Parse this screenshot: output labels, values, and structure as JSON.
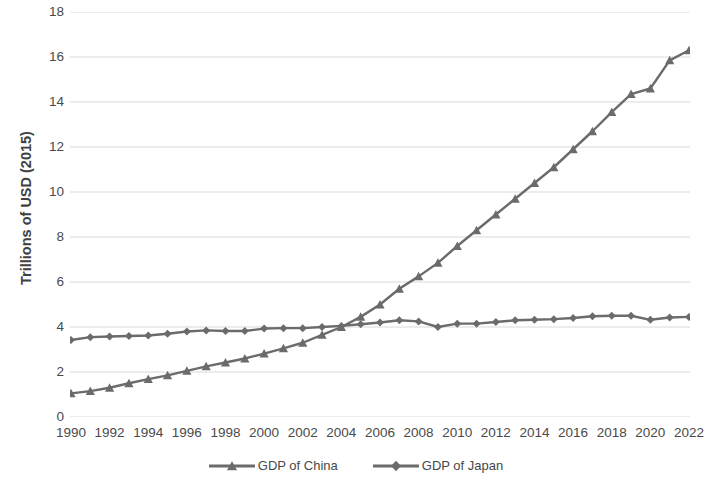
{
  "chart_data": {
    "type": "line",
    "title": "",
    "xlabel": "",
    "ylabel": "Trillions of USD (2015)",
    "xlim": [
      1990,
      2022
    ],
    "ylim": [
      0,
      18
    ],
    "ytick_step": 2,
    "xtick_step": 2,
    "grid": true,
    "grid_axis": "y",
    "legend_position": "bottom",
    "x": [
      1990,
      1991,
      1992,
      1993,
      1994,
      1995,
      1996,
      1997,
      1998,
      1999,
      2000,
      2001,
      2002,
      2003,
      2004,
      2005,
      2006,
      2007,
      2008,
      2009,
      2010,
      2011,
      2012,
      2013,
      2014,
      2015,
      2016,
      2017,
      2018,
      2019,
      2020,
      2021,
      2022
    ],
    "yticks": [
      0,
      2,
      4,
      6,
      8,
      10,
      12,
      14,
      16,
      18
    ],
    "ytick_labels": [
      "0",
      "2",
      "4",
      "6",
      "8",
      "10",
      "12",
      "14",
      "16",
      "18"
    ],
    "xticks": [
      1990,
      1992,
      1994,
      1996,
      1998,
      2000,
      2002,
      2004,
      2006,
      2008,
      2010,
      2012,
      2014,
      2016,
      2018,
      2020,
      2022
    ],
    "xtick_labels": [
      "1990",
      "1992",
      "1994",
      "1996",
      "1998",
      "2000",
      "2002",
      "2004",
      "2006",
      "2008",
      "2010",
      "2012",
      "2014",
      "2016",
      "2018",
      "2020",
      "2022"
    ],
    "series": [
      {
        "name": "GDP of China",
        "marker": "triangle",
        "color": "#6b6b6b",
        "values": [
          1.05,
          1.15,
          1.3,
          1.5,
          1.68,
          1.85,
          2.05,
          2.25,
          2.42,
          2.6,
          2.82,
          3.05,
          3.3,
          3.65,
          4.0,
          4.45,
          5.0,
          5.7,
          6.25,
          6.85,
          7.6,
          8.3,
          9.0,
          9.7,
          10.4,
          11.1,
          11.9,
          12.7,
          13.55,
          14.35,
          14.6,
          15.85,
          16.3
        ]
      },
      {
        "name": "GDP of Japan",
        "marker": "diamond",
        "color": "#6b6b6b",
        "values": [
          3.42,
          3.55,
          3.58,
          3.6,
          3.62,
          3.7,
          3.8,
          3.85,
          3.82,
          3.82,
          3.93,
          3.95,
          3.95,
          4.0,
          4.05,
          4.12,
          4.2,
          4.3,
          4.25,
          4.0,
          4.15,
          4.15,
          4.22,
          4.3,
          4.32,
          4.35,
          4.4,
          4.48,
          4.5,
          4.5,
          4.32,
          4.42,
          4.45
        ]
      }
    ]
  },
  "style": {
    "gridline_color": "#d9d9d9",
    "text_color": "#4a4a4a",
    "background": "#ffffff",
    "line_color": "#6b6b6b"
  },
  "legend": {
    "items": [
      {
        "label": "GDP of China",
        "marker": "triangle-marker-icon"
      },
      {
        "label": "GDP of Japan",
        "marker": "diamond-marker-icon"
      }
    ]
  },
  "axis": {
    "y_title": "Trillions of USD (2015)"
  }
}
